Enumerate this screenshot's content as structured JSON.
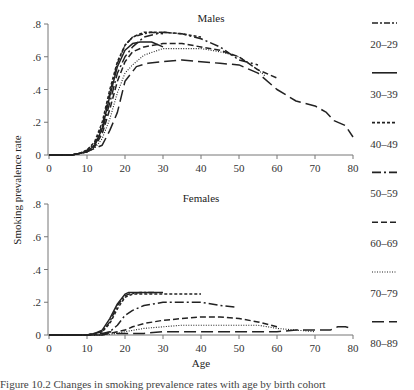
{
  "chart_data": {
    "type": "line",
    "ylabel": "Smoking prevalence rate",
    "xlabel": "Age",
    "xlim": [
      0,
      80
    ],
    "x_ticks": [
      "0",
      "10",
      "20",
      "30",
      "40",
      "50",
      "60",
      "70",
      "80"
    ],
    "ylim": [
      0,
      0.8
    ],
    "y_ticks": [
      "0",
      ".2",
      ".4",
      ".6",
      ".8"
    ],
    "grid": false,
    "legend_position": "right",
    "legend": [
      "20–29",
      "30–39",
      "40–49",
      "50–59",
      "60–69",
      "70–79",
      "80–89"
    ],
    "panels": [
      {
        "title": "Males",
        "series": [
          {
            "name": "20–29",
            "style": "dash-dot",
            "x": [
              0,
              6,
              8,
              10,
              12,
              14,
              16,
              18,
              20,
              22,
              25,
              27,
              30
            ],
            "values": [
              0,
              0,
              0.01,
              0.03,
              0.07,
              0.18,
              0.38,
              0.56,
              0.67,
              0.72,
              0.74,
              0.75,
              0.74
            ]
          },
          {
            "name": "30–39",
            "style": "solid",
            "x": [
              0,
              6,
              8,
              10,
              12,
              14,
              16,
              18,
              20,
              22,
              24,
              27,
              30
            ],
            "values": [
              0,
              0,
              0.01,
              0.02,
              0.06,
              0.16,
              0.36,
              0.54,
              0.64,
              0.68,
              0.69,
              0.69,
              0.66
            ]
          },
          {
            "name": "40–49",
            "style": "short-dash",
            "x": [
              0,
              6,
              8,
              10,
              12,
              14,
              16,
              18,
              20,
              22,
              25,
              30,
              35,
              40
            ],
            "values": [
              0,
              0,
              0.01,
              0.03,
              0.08,
              0.2,
              0.4,
              0.57,
              0.67,
              0.72,
              0.75,
              0.75,
              0.74,
              0.72
            ]
          },
          {
            "name": "50–59",
            "style": "long-dash-dot",
            "x": [
              0,
              6,
              8,
              10,
              12,
              14,
              16,
              18,
              20,
              22,
              25,
              30,
              35,
              40,
              45,
              50,
              55
            ],
            "values": [
              0,
              0,
              0.01,
              0.02,
              0.06,
              0.15,
              0.32,
              0.5,
              0.6,
              0.66,
              0.72,
              0.75,
              0.74,
              0.71,
              0.66,
              0.58,
              0.55
            ]
          },
          {
            "name": "60–69",
            "style": "dash",
            "x": [
              0,
              6,
              8,
              10,
              12,
              14,
              16,
              18,
              20,
              22,
              25,
              30,
              35,
              40,
              45,
              50,
              55,
              60
            ],
            "values": [
              0,
              0,
              0.01,
              0.02,
              0.05,
              0.13,
              0.28,
              0.45,
              0.57,
              0.63,
              0.66,
              0.68,
              0.68,
              0.66,
              0.64,
              0.6,
              0.52,
              0.47
            ]
          },
          {
            "name": "70–79",
            "style": "dotted",
            "x": [
              0,
              6,
              8,
              10,
              12,
              14,
              16,
              18,
              20,
              22,
              25,
              30,
              35,
              40,
              45,
              50,
              55,
              57
            ],
            "values": [
              0,
              0,
              0.01,
              0.02,
              0.04,
              0.1,
              0.22,
              0.38,
              0.5,
              0.55,
              0.61,
              0.65,
              0.65,
              0.65,
              0.63,
              0.6,
              0.52,
              0.48
            ]
          },
          {
            "name": "80–89",
            "style": "long-dash",
            "x": [
              0,
              6,
              8,
              10,
              12,
              13,
              14,
              16,
              18,
              20,
              23,
              26,
              30,
              35,
              40,
              45,
              50,
              55,
              60,
              65,
              70,
              73,
              75,
              78,
              80
            ],
            "values": [
              0,
              0,
              0.01,
              0.02,
              0.04,
              0.05,
              0.06,
              0.15,
              0.26,
              0.45,
              0.54,
              0.56,
              0.57,
              0.58,
              0.57,
              0.56,
              0.55,
              0.5,
              0.4,
              0.33,
              0.3,
              0.26,
              0.21,
              0.18,
              0.11
            ]
          }
        ]
      },
      {
        "title": "Females",
        "series": [
          {
            "name": "20–29",
            "style": "dash-dot",
            "x": [
              0,
              10,
              12,
              14,
              16,
              18,
              20,
              21,
              24,
              28
            ],
            "values": [
              0,
              0,
              0.01,
              0.02,
              0.08,
              0.18,
              0.24,
              0.25,
              0.26,
              0.26
            ]
          },
          {
            "name": "30–39",
            "style": "solid",
            "x": [
              0,
              10,
              12,
              14,
              16,
              18,
              20,
              21,
              24,
              30
            ],
            "values": [
              0,
              0,
              0.01,
              0.03,
              0.1,
              0.19,
              0.25,
              0.26,
              0.26,
              0.26
            ]
          },
          {
            "name": "40–49",
            "style": "short-dash",
            "x": [
              0,
              10,
              12,
              14,
              16,
              18,
              20,
              22,
              25,
              30,
              35,
              40
            ],
            "values": [
              0,
              0,
              0.01,
              0.02,
              0.07,
              0.16,
              0.23,
              0.25,
              0.25,
              0.25,
              0.25,
              0.25
            ]
          },
          {
            "name": "50–59",
            "style": "long-dash-dot",
            "x": [
              0,
              10,
              14,
              16,
              18,
              20,
              22,
              25,
              30,
              35,
              40,
              45,
              49
            ],
            "values": [
              0,
              0,
              0.01,
              0.02,
              0.06,
              0.12,
              0.15,
              0.18,
              0.2,
              0.2,
              0.2,
              0.18,
              0.17
            ]
          },
          {
            "name": "60–69",
            "style": "dash",
            "x": [
              0,
              10,
              14,
              16,
              18,
              20,
              22,
              25,
              30,
              35,
              40,
              45,
              50,
              55,
              60
            ],
            "values": [
              0,
              0,
              0,
              0.01,
              0.02,
              0.03,
              0.05,
              0.07,
              0.09,
              0.1,
              0.11,
              0.11,
              0.1,
              0.08,
              0.05
            ]
          },
          {
            "name": "70–79",
            "style": "dotted",
            "x": [
              0,
              10,
              14,
              18,
              20,
              25,
              30,
              35,
              40,
              45,
              50,
              55,
              60,
              65,
              70
            ],
            "values": [
              0,
              0,
              0,
              0.01,
              0.02,
              0.04,
              0.05,
              0.06,
              0.06,
              0.06,
              0.06,
              0.06,
              0.04,
              0.03,
              0.02
            ]
          },
          {
            "name": "80–89",
            "style": "long-dash",
            "x": [
              0,
              10,
              14,
              16,
              18,
              20,
              25,
              30,
              35,
              40,
              45,
              50,
              55,
              60,
              65,
              70,
              72,
              74,
              76,
              78,
              80
            ],
            "values": [
              0,
              0,
              0,
              0.02,
              0.01,
              0.01,
              0.01,
              0.02,
              0.02,
              0.02,
              0.02,
              0.02,
              0.02,
              0.02,
              0.03,
              0.03,
              0.03,
              0.03,
              0.05,
              0.05,
              0.04
            ]
          }
        ]
      }
    ]
  },
  "caption": "Figure 10.2  Changes in smoking prevalence rates with age by birth cohort"
}
